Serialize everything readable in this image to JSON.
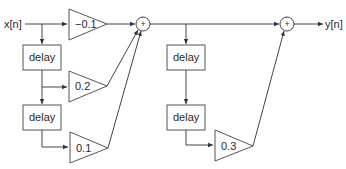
{
  "diagram": {
    "type": "signal-flow block diagram",
    "input_label": "x[n]",
    "output_label": "y[n]",
    "delay_label": "delay",
    "sum_symbol": "+",
    "feedforward_gains": [
      "-0.1",
      "0.2",
      "0.1"
    ],
    "second_stage_gain": "0.3",
    "blocks": [
      {
        "id": "gain-a",
        "kind": "gain",
        "label": "-0.1"
      },
      {
        "id": "delay-1",
        "kind": "delay",
        "label": "delay"
      },
      {
        "id": "gain-b",
        "kind": "gain",
        "label": "0.2"
      },
      {
        "id": "delay-2",
        "kind": "delay",
        "label": "delay"
      },
      {
        "id": "gain-c",
        "kind": "gain",
        "label": "0.1"
      },
      {
        "id": "sum-1",
        "kind": "adder",
        "label": "+"
      },
      {
        "id": "delay-3",
        "kind": "delay",
        "label": "delay"
      },
      {
        "id": "delay-4",
        "kind": "delay",
        "label": "delay"
      },
      {
        "id": "gain-d",
        "kind": "gain",
        "label": "0.3"
      },
      {
        "id": "sum-2",
        "kind": "adder",
        "label": "+"
      }
    ],
    "colors": {
      "stroke": "#555555",
      "text": "#2a2a2a",
      "background": "#ffffff"
    }
  },
  "labels": {
    "input": "x[n]",
    "output": "y[n]",
    "delay1": "delay",
    "delay2": "delay",
    "delay3": "delay",
    "delay4": "delay",
    "gain_a": "−0.1",
    "gain_b": "0.2",
    "gain_c": "0.1",
    "gain_d": "0.3",
    "sum1": "+",
    "sum2": "+"
  }
}
